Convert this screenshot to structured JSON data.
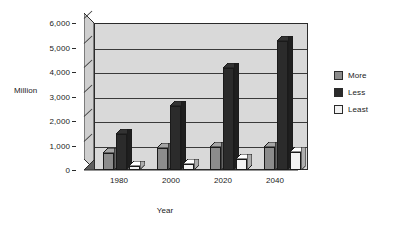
{
  "chart_data": {
    "type": "bar",
    "title": "",
    "subtitle": "",
    "xlabel": "Year",
    "ylabel": "Million",
    "categories": [
      "1980",
      "2000",
      "2020",
      "2040"
    ],
    "series": [
      {
        "name": "More",
        "color": "#8c8c8c",
        "values": [
          700,
          900,
          950,
          950
        ]
      },
      {
        "name": "Less",
        "color": "#2b2b2b",
        "values": [
          1450,
          2600,
          4150,
          5250
        ]
      },
      {
        "name": "Least",
        "color": "#f2f2f2",
        "values": [
          150,
          250,
          450,
          750
        ]
      }
    ],
    "ylim": [
      0,
      6000
    ],
    "yticks": [
      0,
      1000,
      2000,
      3000,
      4000,
      5000,
      6000
    ],
    "ytick_labels": [
      "0",
      "1,000",
      "2,000",
      "3,000",
      "4,000",
      "5,000",
      "6,000"
    ],
    "grid": true,
    "legend_position": "right",
    "style": "3d-clustered-column",
    "plot_background": "#d9d9d9",
    "floor_color": "#5e5e5e",
    "wall_color": "#cfcfcf",
    "axis_color": "#2b2b2b"
  },
  "legend": {
    "items": [
      {
        "label": "More",
        "swatch": "#8c8c8c"
      },
      {
        "label": "Less",
        "swatch": "#2b2b2b"
      },
      {
        "label": "Least",
        "swatch": "#f2f2f2"
      }
    ]
  }
}
